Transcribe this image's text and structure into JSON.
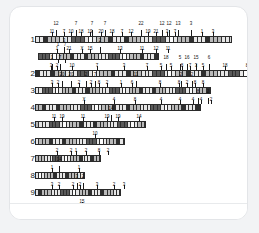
{
  "card": {
    "background": "#ffffff",
    "border_color": "#e3e5e8"
  },
  "chart_data": {
    "type": "bar",
    "title": "",
    "subtitle": "",
    "xlabel": "",
    "ylabel": "",
    "legend": [],
    "grid": false,
    "categories": [
      "1",
      "2",
      "3",
      "4",
      "5",
      "6",
      "7",
      "8",
      "9",
      "10"
    ],
    "values": [
      197,
      214,
      176,
      166,
      111,
      90,
      66,
      50,
      86,
      72
    ],
    "xlim": [
      0,
      220
    ],
    "rows": [
      {
        "label": "1",
        "y": 22,
        "track": {
          "x": 14,
          "width": 197,
          "segments": 48
        },
        "annotations": [
          {
            "text": "12",
            "x": 21,
            "tier": 2
          },
          {
            "text": "11",
            "x": 17,
            "tier": 1
          },
          {
            "text": "7",
            "x": 29,
            "tier": 1
          },
          {
            "text": "7",
            "x": 41,
            "tier": 2
          },
          {
            "text": "10",
            "x": 36,
            "tier": 1
          },
          {
            "text": "18",
            "x": 46,
            "tier": 1
          },
          {
            "text": "7",
            "x": 57,
            "tier": 2
          },
          {
            "text": "19",
            "x": 55,
            "tier": 1
          },
          {
            "text": "7",
            "x": 70,
            "tier": 2
          },
          {
            "text": "20",
            "x": 66,
            "tier": 1
          },
          {
            "text": "18",
            "x": 77,
            "tier": 1
          },
          {
            "text": "7",
            "x": 87,
            "tier": 1
          },
          {
            "text": "22",
            "x": 106,
            "tier": 2
          },
          {
            "text": "12",
            "x": 96,
            "tier": 1
          },
          {
            "text": "19",
            "x": 113,
            "tier": 1
          },
          {
            "text": "21",
            "x": 121,
            "tier": 1
          },
          {
            "text": "12",
            "x": 127,
            "tier": 2
          },
          {
            "text": "12",
            "x": 134,
            "tier": 2
          },
          {
            "text": "13",
            "x": 143,
            "tier": 2
          },
          {
            "text": "3",
            "x": 156,
            "tier": 2
          },
          {
            "text": "3",
            "x": 132,
            "tier": 1
          },
          {
            "text": "7",
            "x": 140,
            "tier": 1
          },
          {
            "text": "1",
            "x": 167,
            "tier": 1
          },
          {
            "text": "3",
            "x": 178,
            "tier": 1
          }
        ]
      },
      {
        "label": "",
        "y": 39,
        "track": {
          "x": 17,
          "width": 121,
          "segments": 34
        },
        "annotations": [
          {
            "text": "3",
            "x": 26,
            "tier": 2
          },
          {
            "text": "1",
            "x": 19,
            "tier": 1
          },
          {
            "text": "21",
            "x": 31,
            "tier": 1
          },
          {
            "text": "X",
            "x": 44,
            "tier": 1
          },
          {
            "text": "15",
            "x": 52,
            "tier": 1
          },
          {
            "text": "2",
            "x": 62,
            "tier": 2
          },
          {
            "text": "13",
            "x": 82,
            "tier": 1
          },
          {
            "text": "11",
            "x": 104,
            "tier": 1
          },
          {
            "text": "12",
            "x": 118,
            "tier": 1
          },
          {
            "text": "11",
            "x": 130,
            "tier": 1
          },
          {
            "text": "1",
            "x": 20,
            "tier": 0
          },
          {
            "text": "7",
            "x": 27,
            "tier": 0
          }
        ]
      },
      {
        "label": "2",
        "y": 56,
        "track": {
          "x": 14,
          "width": 214,
          "segments": 56
        },
        "annotations": [
          {
            "text": "1",
            "x": 17,
            "tier": 2
          },
          {
            "text": "7",
            "x": 25,
            "tier": 2
          },
          {
            "text": "3",
            "x": 16,
            "tier": 1
          },
          {
            "text": "2",
            "x": 22,
            "tier": 1
          },
          {
            "text": "10",
            "x": 37,
            "tier": 1
          },
          {
            "text": "7",
            "x": 62,
            "tier": 1
          },
          {
            "text": "3",
            "x": 89,
            "tier": 1
          },
          {
            "text": "7",
            "x": 112,
            "tier": 1
          },
          {
            "text": "18",
            "x": 131,
            "tier": 2
          },
          {
            "text": "5",
            "x": 126,
            "tier": 1
          },
          {
            "text": "5",
            "x": 136,
            "tier": 1
          },
          {
            "text": "5",
            "x": 145,
            "tier": 2
          },
          {
            "text": "16",
            "x": 152,
            "tier": 2
          },
          {
            "text": "15",
            "x": 161,
            "tier": 2
          },
          {
            "text": "6",
            "x": 174,
            "tier": 2
          },
          {
            "text": "8",
            "x": 147,
            "tier": 1
          },
          {
            "text": "7",
            "x": 155,
            "tier": 1
          },
          {
            "text": "3",
            "x": 161,
            "tier": 1
          },
          {
            "text": "5",
            "x": 168,
            "tier": 1
          },
          {
            "text": "18",
            "x": 190,
            "tier": 1
          },
          {
            "text": "8",
            "x": 212,
            "tier": 1
          }
        ]
      },
      {
        "label": "3",
        "y": 73,
        "track": {
          "x": 14,
          "width": 176,
          "segments": 52
        },
        "annotations": [
          {
            "text": "20",
            "x": 27,
            "tier": 2
          },
          {
            "text": "20",
            "x": 36,
            "tier": 2
          },
          {
            "text": "3",
            "x": 17,
            "tier": 1
          },
          {
            "text": "2",
            "x": 23,
            "tier": 1
          },
          {
            "text": "2",
            "x": 44,
            "tier": 1
          },
          {
            "text": "2",
            "x": 51,
            "tier": 2
          },
          {
            "text": "7",
            "x": 60,
            "tier": 2
          },
          {
            "text": "2",
            "x": 56,
            "tier": 1
          },
          {
            "text": "8",
            "x": 64,
            "tier": 1
          },
          {
            "text": "2",
            "x": 72,
            "tier": 1
          },
          {
            "text": "1",
            "x": 86,
            "tier": 1
          },
          {
            "text": "11",
            "x": 101,
            "tier": 2
          },
          {
            "text": "6",
            "x": 97,
            "tier": 1
          },
          {
            "text": "8",
            "x": 125,
            "tier": 1
          },
          {
            "text": "2",
            "x": 146,
            "tier": 2
          },
          {
            "text": "2",
            "x": 157,
            "tier": 2
          },
          {
            "text": "8",
            "x": 144,
            "tier": 1
          },
          {
            "text": "2",
            "x": 152,
            "tier": 1
          },
          {
            "text": "8",
            "x": 160,
            "tier": 1
          },
          {
            "text": "8",
            "x": 168,
            "tier": 1
          }
        ]
      },
      {
        "label": "4",
        "y": 90,
        "track": {
          "x": 14,
          "width": 166,
          "segments": 47
        },
        "annotations": [
          {
            "text": "X",
            "x": 49,
            "tier": 1
          },
          {
            "text": "4",
            "x": 79,
            "tier": 1
          },
          {
            "text": "8",
            "x": 100,
            "tier": 1
          },
          {
            "text": "4",
            "x": 126,
            "tier": 1
          },
          {
            "text": "4",
            "x": 145,
            "tier": 1
          },
          {
            "text": "4",
            "x": 158,
            "tier": 1
          },
          {
            "text": "8",
            "x": 163,
            "tier": 2
          },
          {
            "text": "4",
            "x": 166,
            "tier": 1
          },
          {
            "text": "2",
            "x": 173,
            "tier": 2
          },
          {
            "text": "2",
            "x": 176,
            "tier": 1
          }
        ]
      },
      {
        "label": "5",
        "y": 107,
        "track": {
          "x": 14,
          "width": 111,
          "segments": 32
        },
        "annotations": [
          {
            "text": "11",
            "x": 19,
            "tier": 1
          },
          {
            "text": "19",
            "x": 27,
            "tier": 1
          },
          {
            "text": "11",
            "x": 48,
            "tier": 1
          },
          {
            "text": "14",
            "x": 76,
            "tier": 2
          },
          {
            "text": "19",
            "x": 72,
            "tier": 1
          },
          {
            "text": "19",
            "x": 83,
            "tier": 1
          },
          {
            "text": "14",
            "x": 104,
            "tier": 1
          }
        ]
      },
      {
        "label": "6",
        "y": 124,
        "track": {
          "x": 14,
          "width": 90,
          "segments": 26
        },
        "annotations": [
          {
            "text": "10",
            "x": 60,
            "tier": 1
          }
        ]
      },
      {
        "label": "7",
        "y": 141,
        "track": {
          "x": 14,
          "width": 66,
          "segments": 22
        },
        "annotations": [
          {
            "text": "2",
            "x": 22,
            "tier": 1
          },
          {
            "text": "2",
            "x": 36,
            "tier": 1
          },
          {
            "text": "1",
            "x": 41,
            "tier": 1
          },
          {
            "text": "2",
            "x": 51,
            "tier": 1
          },
          {
            "text": "8",
            "x": 64,
            "tier": 1
          },
          {
            "text": "2",
            "x": 73,
            "tier": 1
          }
        ]
      },
      {
        "label": "8",
        "y": 158,
        "track": {
          "x": 14,
          "width": 50,
          "segments": 16
        },
        "annotations": [
          {
            "text": "14",
            "x": 24,
            "tier": 2
          },
          {
            "text": "1",
            "x": 17,
            "tier": 1
          },
          {
            "text": "1",
            "x": 44,
            "tier": 1
          }
        ]
      },
      {
        "label": "9",
        "y": 175,
        "track": {
          "x": 14,
          "width": 86,
          "segments": 27
        },
        "annotations": [
          {
            "text": "3",
            "x": 17,
            "tier": 1
          },
          {
            "text": "2",
            "x": 24,
            "tier": 1
          },
          {
            "text": "3",
            "x": 42,
            "tier": 2
          },
          {
            "text": "2",
            "x": 48,
            "tier": 2
          },
          {
            "text": "2",
            "x": 38,
            "tier": 1
          },
          {
            "text": "2",
            "x": 45,
            "tier": 1
          },
          {
            "text": "3",
            "x": 62,
            "tier": 1
          },
          {
            "text": "2",
            "x": 79,
            "tier": 1
          },
          {
            "text": "3",
            "x": 89,
            "tier": 1
          }
        ]
      },
      {
        "label": "10",
        "y": 192,
        "track": {
          "x": 14,
          "width": 72,
          "segments": 23
        },
        "annotations": [
          {
            "text": "15",
            "x": 47,
            "tier": 1
          }
        ]
      }
    ]
  }
}
